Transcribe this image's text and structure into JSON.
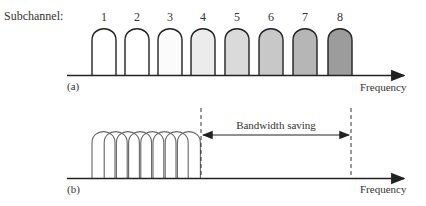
{
  "panel_a": {
    "label": "(a)",
    "row_title": "Subchannel:",
    "axis_label": "Frequency",
    "subchannels": [
      {
        "num": "1",
        "x": 92,
        "fill": "#ffffff"
      },
      {
        "num": "2",
        "x": 125,
        "fill": "#ffffff"
      },
      {
        "num": "3",
        "x": 158,
        "fill": "#fbfbfb"
      },
      {
        "num": "4",
        "x": 191,
        "fill": "#ececec"
      },
      {
        "num": "5",
        "x": 225,
        "fill": "#dadada"
      },
      {
        "num": "6",
        "x": 259,
        "fill": "#c8c8c8"
      },
      {
        "num": "7",
        "x": 293,
        "fill": "#b6b6b6"
      },
      {
        "num": "8",
        "x": 328,
        "fill": "#9c9c9c"
      }
    ]
  },
  "panel_b": {
    "label": "(b)",
    "axis_label": "Frequency",
    "bandwidth_label": "Bandwidth saving",
    "overlapped_count": 8
  }
}
